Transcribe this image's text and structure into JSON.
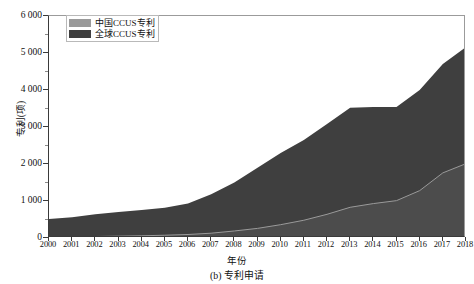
{
  "chart_data": {
    "type": "area",
    "title": "",
    "caption": "(b) 专利申请",
    "xlabel": "年份",
    "ylabel": "专利(项)",
    "grid": false,
    "legend_position": "top-left",
    "xlim": [
      2000,
      2018
    ],
    "ylim": [
      0,
      6000
    ],
    "ytick_step": 1000,
    "ytick_labels": [
      "0",
      "1 000",
      "2 000",
      "3 000",
      "4 000",
      "5 000",
      "6 000"
    ],
    "ytick_values": [
      0,
      1000,
      2000,
      3000,
      4000,
      5000,
      6000
    ],
    "categories": [
      "2000",
      "2001",
      "2002",
      "2003",
      "2004",
      "2005",
      "2006",
      "2007",
      "2008",
      "2009",
      "2010",
      "2011",
      "2012",
      "2013",
      "2014",
      "2015",
      "2016",
      "2017",
      "2018"
    ],
    "series": [
      {
        "name": "全球CCUS专利",
        "color": "#3f3f3f",
        "values": [
          515,
          560,
          640,
          700,
          760,
          820,
          930,
          1180,
          1500,
          1900,
          2300,
          2650,
          3080,
          3520,
          3540,
          3540,
          4000,
          4700,
          5160
        ]
      },
      {
        "name": "中国CCUS专利",
        "color": "#4a4a4a",
        "values": [
          20,
          30,
          40,
          50,
          60,
          75,
          95,
          130,
          190,
          260,
          360,
          480,
          640,
          830,
          930,
          1010,
          1280,
          1760,
          2010
        ]
      }
    ]
  },
  "legend": {
    "items": [
      {
        "label": "中国CCUS专利",
        "swatch": "#9a9a9a"
      },
      {
        "label": "全球CCUS专利",
        "swatch": "#3f3f3f"
      }
    ]
  },
  "colors": {
    "global_area": "#3f3f3f",
    "china_area": "#4c4c4c",
    "china_line": "#9a9a9a",
    "axis": "#3a3a3a",
    "background": "#ffffff"
  }
}
